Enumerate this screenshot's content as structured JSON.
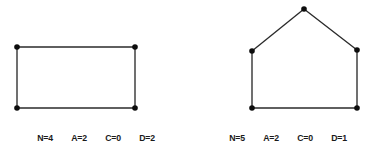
{
  "canvas": {
    "width": 384,
    "height": 152,
    "background_color": "#ffffff",
    "ink_color": "#1a1a1a",
    "edge_color": "#2b2b2b",
    "vertex_color": "#0d0d0d"
  },
  "figures": [
    {
      "id": "rectangle",
      "shape_name": "rectangle",
      "vertex_count": 4,
      "vertices": [
        {
          "id": "v1",
          "x": 17,
          "y": 47
        },
        {
          "id": "v2",
          "x": 135,
          "y": 47
        },
        {
          "id": "v3",
          "x": 135,
          "y": 108
        },
        {
          "id": "v4",
          "x": 17,
          "y": 108
        }
      ],
      "edges": [
        {
          "from": "v1",
          "to": "v2"
        },
        {
          "from": "v2",
          "to": "v3"
        },
        {
          "from": "v3",
          "to": "v4"
        },
        {
          "from": "v4",
          "to": "v1"
        }
      ],
      "caption": {
        "items": [
          {
            "key": "N",
            "value": "4",
            "text": "N=4"
          },
          {
            "key": "A",
            "value": "2",
            "text": "A=2"
          },
          {
            "key": "C",
            "value": "0",
            "text": "C=0"
          },
          {
            "key": "D",
            "value": "2",
            "text": "D=2"
          }
        ],
        "full_text": "N=4   A=2   C=0   D=2"
      }
    },
    {
      "id": "pentagon",
      "shape_name": "house-pentagon",
      "vertex_count": 5,
      "vertices": [
        {
          "id": "v1",
          "x": 112,
          "y": 9
        },
        {
          "id": "v2",
          "x": 165,
          "y": 50
        },
        {
          "id": "v3",
          "x": 165,
          "y": 108
        },
        {
          "id": "v4",
          "x": 60,
          "y": 108
        },
        {
          "id": "v5",
          "x": 60,
          "y": 51
        }
      ],
      "edges": [
        {
          "from": "v1",
          "to": "v2"
        },
        {
          "from": "v2",
          "to": "v3"
        },
        {
          "from": "v3",
          "to": "v4"
        },
        {
          "from": "v4",
          "to": "v5"
        },
        {
          "from": "v5",
          "to": "v1"
        }
      ],
      "caption": {
        "items": [
          {
            "key": "N",
            "value": "5",
            "text": "N=5"
          },
          {
            "key": "A",
            "value": "2",
            "text": "A=2"
          },
          {
            "key": "C",
            "value": "0",
            "text": "C=0"
          },
          {
            "key": "D",
            "value": "1",
            "text": "D=1"
          }
        ],
        "full_text": "N=5   A=2   C=0   D=1"
      }
    }
  ]
}
